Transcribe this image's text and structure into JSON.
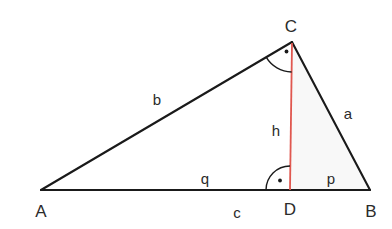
{
  "diagram": {
    "canvas": {
      "width": 392,
      "height": 229,
      "background": "#ffffff"
    },
    "colors": {
      "stroke": "#1a1a1a",
      "altitude": "#e0574f",
      "label_text": "#2b2b2b",
      "shade": "#f7f7f7"
    },
    "points": {
      "A": {
        "x": 41,
        "y": 190
      },
      "B": {
        "x": 370,
        "y": 190
      },
      "C": {
        "x": 292,
        "y": 42
      },
      "D": {
        "x": 290,
        "y": 190
      }
    },
    "vertex_labels": [
      {
        "id": "vertex-label-A",
        "text": "A",
        "x": 41,
        "y": 211
      },
      {
        "id": "vertex-label-B",
        "text": "B",
        "x": 371,
        "y": 211
      },
      {
        "id": "vertex-label-C",
        "text": "C",
        "x": 291,
        "y": 26
      },
      {
        "id": "vertex-label-D",
        "text": "D",
        "x": 290,
        "y": 209
      }
    ],
    "segment_labels": [
      {
        "id": "segment-label-b",
        "text": "b",
        "x": 157,
        "y": 99
      },
      {
        "id": "segment-label-a",
        "text": "a",
        "x": 348,
        "y": 113
      },
      {
        "id": "segment-label-h",
        "text": "h",
        "x": 276,
        "y": 130
      },
      {
        "id": "segment-label-q",
        "text": "q",
        "x": 205,
        "y": 178
      },
      {
        "id": "segment-label-p",
        "text": "p",
        "x": 331,
        "y": 178
      },
      {
        "id": "segment-label-c",
        "text": "c",
        "x": 237,
        "y": 212
      }
    ],
    "segments": [
      {
        "name": "side-b",
        "label": "b",
        "from": "A",
        "to": "C",
        "color": "#1a1a1a"
      },
      {
        "name": "side-a",
        "label": "a",
        "from": "C",
        "to": "B",
        "color": "#1a1a1a"
      },
      {
        "name": "side-c",
        "label": "c",
        "from": "A",
        "to": "B",
        "color": "#1a1a1a"
      },
      {
        "name": "altitude-h",
        "label": "h",
        "from": "C",
        "to": "D",
        "color": "#e0574f"
      },
      {
        "name": "sub-segment-q",
        "label": "q",
        "from": "A",
        "to": "D",
        "color": "#1a1a1a"
      },
      {
        "name": "sub-segment-p",
        "label": "p",
        "from": "D",
        "to": "B",
        "color": "#1a1a1a"
      }
    ],
    "right_angle_markers": [
      {
        "name": "right-angle-at-C",
        "vertex": "C",
        "dot_x": 287,
        "dot_y": 51
      },
      {
        "name": "right-angle-at-D",
        "vertex": "D",
        "dot_x": 280,
        "dot_y": 181
      }
    ]
  }
}
